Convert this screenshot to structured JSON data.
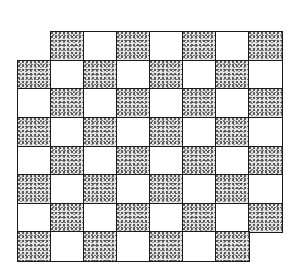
{
  "figure": {
    "type": "mutilated-checkerboard",
    "rows": 8,
    "cols": 8,
    "removed_cells": [
      {
        "row": 0,
        "col": 0
      },
      {
        "row": 7,
        "col": 7
      }
    ],
    "shading_rule": "shaded when (row + col) is odd",
    "colors": {
      "line": "#1a1a1a",
      "light_cell": "#ffffff",
      "shaded_cell": "#e4e4e4",
      "stipple": "#555555"
    },
    "geometry": {
      "origin_x": 18,
      "origin_y": 32,
      "cell_width": 33,
      "cell_height": 28.6
    }
  }
}
